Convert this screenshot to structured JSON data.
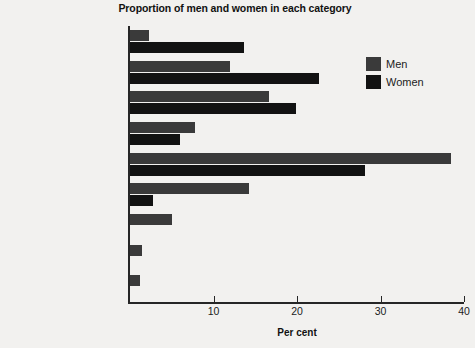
{
  "chart_data": {
    "type": "bar",
    "orientation": "horizontal",
    "title": "Proportion of men and women in each category",
    "xlabel": "Per cent",
    "ylabel": "",
    "xlim": [
      0,
      40
    ],
    "xticks": [
      0,
      10,
      20,
      30,
      40
    ],
    "xtick_labels": [
      "",
      "10",
      "20",
      "30",
      "40"
    ],
    "grid": false,
    "legend_position": "top-right",
    "categories": [
      "Marketing assistant",
      "Marketing executive",
      "Brand manager",
      "Group product manager",
      "Marketing manager",
      "Marketing director",
      "Managing director/\ndeputy MD",
      "Chairman/chief executive",
      "Proprietor"
    ],
    "series": [
      {
        "name": "Men",
        "color": "#3a3a3a",
        "values": [
          2.3,
          12.0,
          16.7,
          7.8,
          38.4,
          14.2,
          5.0,
          1.4,
          1.2
        ]
      },
      {
        "name": "Women",
        "color": "#121212",
        "values": [
          13.6,
          22.6,
          19.9,
          6.0,
          28.2,
          2.8,
          0.0,
          0.0,
          0.0
        ]
      }
    ]
  },
  "legend": {
    "items": [
      {
        "label": "Men",
        "color": "#3a3a3a"
      },
      {
        "label": "Women",
        "color": "#121212"
      }
    ]
  }
}
